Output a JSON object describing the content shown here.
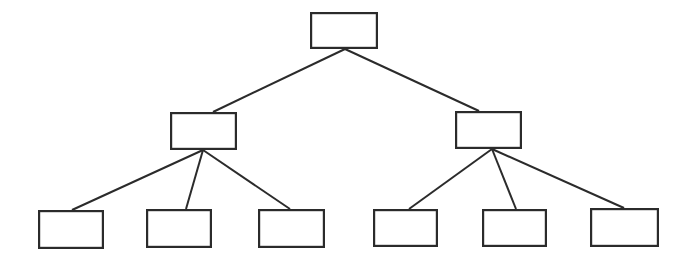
{
  "canvas": {
    "width": 687,
    "height": 261,
    "background_color": "#ffffff"
  },
  "style": {
    "box_stroke_color": "#2b2b2b",
    "box_stroke_width": 2.2,
    "box_fill_color": "#ffffff",
    "connector_stroke_color": "#2b2b2b",
    "connector_stroke_width": 2.0
  },
  "diagram": {
    "type": "tree",
    "title": "",
    "levels": 3,
    "node_count": 9,
    "edge_count": 8,
    "nodes": [
      {
        "id": "root",
        "name": "root-node",
        "label": "",
        "level": 0,
        "x": 310,
        "y": 12,
        "width": 68,
        "height": 37
      },
      {
        "id": "branch-left",
        "name": "branch-node-left",
        "label": "",
        "level": 1,
        "x": 170,
        "y": 112,
        "width": 67,
        "height": 38
      },
      {
        "id": "branch-right",
        "name": "branch-node-right",
        "label": "",
        "level": 1,
        "x": 455,
        "y": 111,
        "width": 67,
        "height": 38
      },
      {
        "id": "leaf-1",
        "name": "leaf-node-1",
        "label": "",
        "level": 2,
        "x": 38,
        "y": 210,
        "width": 66,
        "height": 39
      },
      {
        "id": "leaf-2",
        "name": "leaf-node-2",
        "label": "",
        "level": 2,
        "x": 146,
        "y": 209,
        "width": 66,
        "height": 39
      },
      {
        "id": "leaf-3",
        "name": "leaf-node-3",
        "label": "",
        "level": 2,
        "x": 258,
        "y": 209,
        "width": 67,
        "height": 39
      },
      {
        "id": "leaf-4",
        "name": "leaf-node-4",
        "label": "",
        "level": 2,
        "x": 373,
        "y": 209,
        "width": 65,
        "height": 38
      },
      {
        "id": "leaf-5",
        "name": "leaf-node-5",
        "label": "",
        "level": 2,
        "x": 482,
        "y": 209,
        "width": 65,
        "height": 38
      },
      {
        "id": "leaf-6",
        "name": "leaf-node-6",
        "label": "",
        "level": 2,
        "x": 590,
        "y": 208,
        "width": 69,
        "height": 39
      }
    ],
    "edges": [
      {
        "id": "edge-root-left",
        "name": "connector-root-to-branch-left",
        "from": "root",
        "to": "branch-left",
        "x1": 345,
        "y1": 49,
        "x2": 213,
        "y2": 112
      },
      {
        "id": "edge-root-right",
        "name": "connector-root-to-branch-right",
        "from": "root",
        "to": "branch-right",
        "x1": 345,
        "y1": 49,
        "x2": 479,
        "y2": 111
      },
      {
        "id": "edge-left-1",
        "name": "connector-branch-left-to-leaf-1",
        "from": "branch-left",
        "to": "leaf-1",
        "x1": 203,
        "y1": 150,
        "x2": 72,
        "y2": 210
      },
      {
        "id": "edge-left-2",
        "name": "connector-branch-left-to-leaf-2",
        "from": "branch-left",
        "to": "leaf-2",
        "x1": 203,
        "y1": 150,
        "x2": 186,
        "y2": 209
      },
      {
        "id": "edge-left-3",
        "name": "connector-branch-left-to-leaf-3",
        "from": "branch-left",
        "to": "leaf-3",
        "x1": 203,
        "y1": 150,
        "x2": 290,
        "y2": 209
      },
      {
        "id": "edge-right-4",
        "name": "connector-branch-right-to-leaf-4",
        "from": "branch-right",
        "to": "leaf-4",
        "x1": 492,
        "y1": 149,
        "x2": 409,
        "y2": 209
      },
      {
        "id": "edge-right-5",
        "name": "connector-branch-right-to-leaf-5",
        "from": "branch-right",
        "to": "leaf-5",
        "x1": 492,
        "y1": 149,
        "x2": 516,
        "y2": 209
      },
      {
        "id": "edge-right-6",
        "name": "connector-branch-right-to-leaf-6",
        "from": "branch-right",
        "to": "leaf-6",
        "x1": 492,
        "y1": 149,
        "x2": 624,
        "y2": 208
      }
    ]
  }
}
